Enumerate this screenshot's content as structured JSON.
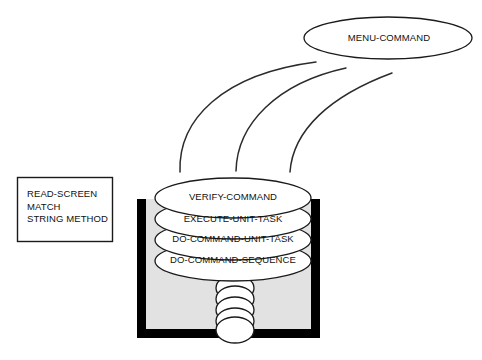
{
  "diagram": {
    "background_color": "#ffffff",
    "line_color": "#1a1a1a",
    "container_fill": "#e2e2e2",
    "container_border_color": "#000000",
    "ellipse_fill": "#ffffff"
  },
  "nodes": {
    "menu_command": {
      "label": "MENU-COMMAND",
      "shape": "ellipse",
      "cx": 388,
      "cy": 38,
      "rx": 84,
      "ry": 21
    },
    "read_screen_box": {
      "shape": "rectangle",
      "x": 17,
      "y": 177,
      "width": 96,
      "height": 65,
      "lines": [
        "READ-SCREEN",
        "MATCH",
        "STRING METHOD"
      ],
      "text": "READ-SCREEN\nMATCH\nSTRING METHOD"
    }
  },
  "stack": {
    "container": {
      "x": 137,
      "y": 199,
      "width": 183,
      "height": 139,
      "border_width": 9,
      "fill": "#e2e2e2"
    },
    "layers": [
      {
        "label": "VERIFY-COMMAND",
        "cx": 233,
        "cy": 198,
        "rx": 78,
        "ry": 20
      },
      {
        "label": "EXECUTE-UNIT-TASK",
        "cx": 233,
        "cy": 219,
        "rx": 78,
        "ry": 20
      },
      {
        "label": "DO-COMMAND-UNIT-TASK",
        "cx": 233,
        "cy": 240,
        "rx": 78,
        "ry": 20
      },
      {
        "label": "DO-COMMAND-SEQUENCE",
        "cx": 233,
        "cy": 261,
        "rx": 78,
        "ry": 20
      }
    ],
    "coil": {
      "count": 5,
      "cx": 235,
      "start_y": 288,
      "spacing": 11,
      "rx": 19,
      "ry": 13
    }
  },
  "connectors": [
    {
      "name": "arc-left",
      "from": "menu_command",
      "to": "stack",
      "path": "M 180 172 C 178 120 222 74 316 62"
    },
    {
      "name": "arc-middle",
      "from": "menu_command",
      "to": "stack",
      "path": "M 236 171 C 237 124 277 83 346 68"
    },
    {
      "name": "arc-right",
      "from": "menu_command",
      "to": "stack",
      "path": "M 290 172 C 293 130 330 96 392 73"
    }
  ]
}
